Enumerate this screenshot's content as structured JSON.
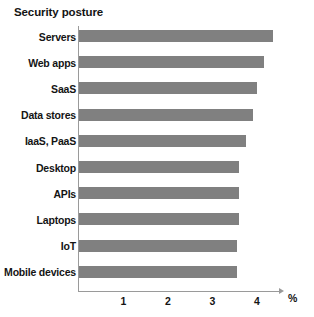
{
  "chart_data": {
    "type": "bar",
    "orientation": "horizontal",
    "title": "Security posture",
    "xlabel": "%",
    "ylabel": "",
    "categories": [
      "Servers",
      "Web apps",
      "SaaS",
      "Data stores",
      "IaaS,  PaaS",
      "Desktop",
      "APIs",
      "Laptops",
      "IoT",
      "Mobile devices"
    ],
    "values": [
      4.35,
      4.15,
      4.0,
      3.9,
      3.75,
      3.6,
      3.6,
      3.6,
      3.55,
      3.55
    ],
    "xticks": [
      "1",
      "2",
      "3",
      "4"
    ],
    "xtick_values": [
      1,
      2,
      3,
      4
    ],
    "xlim": [
      0,
      4.55
    ],
    "grid": false,
    "legend": null,
    "bar_color": "#808080",
    "axis_color": "#9a9a9a"
  }
}
